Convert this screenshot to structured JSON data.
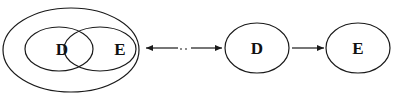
{
  "diagram": {
    "left_group": {
      "outer_container": "outer ellipse",
      "circles": [
        {
          "label": "D"
        },
        {
          "label": "E"
        }
      ]
    },
    "middle_arrow": {
      "type": "bidirectional",
      "style": "solid with dotted middle"
    },
    "right_group": {
      "nodes": [
        {
          "label": "D"
        },
        {
          "label": "E"
        }
      ],
      "arrow": {
        "from": "D",
        "to": "E",
        "type": "directed"
      }
    },
    "colors": {
      "stroke": "#1a1a1a",
      "background": "#ffffff",
      "text": "#111111"
    }
  }
}
